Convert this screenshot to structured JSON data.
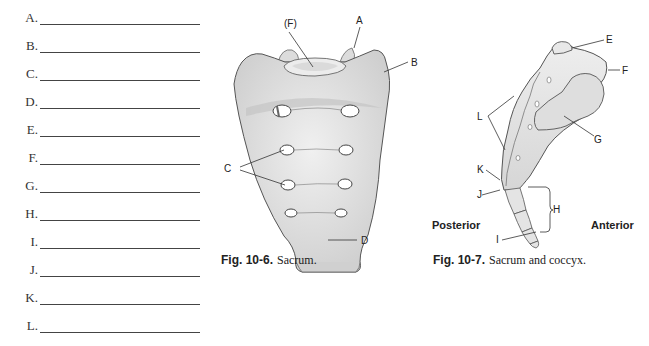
{
  "answer_blanks": [
    {
      "letter": "A."
    },
    {
      "letter": "B."
    },
    {
      "letter": "C."
    },
    {
      "letter": "D."
    },
    {
      "letter": "E."
    },
    {
      "letter": "F."
    },
    {
      "letter": "G."
    },
    {
      "letter": "H."
    },
    {
      "letter": "I."
    },
    {
      "letter": "J."
    },
    {
      "letter": "K."
    },
    {
      "letter": "L."
    }
  ],
  "figure_sacrum": {
    "caption_number": "Fig. 10-6.",
    "caption_text": "Sacrum.",
    "labels": {
      "F": "(F)",
      "A": "A",
      "B": "B",
      "C": "C",
      "D": "D"
    }
  },
  "figure_sacrum_coccyx": {
    "caption_number": "Fig. 10-7.",
    "caption_text": "Sacrum and coccyx.",
    "labels": {
      "E": "E",
      "F": "F",
      "G": "G",
      "L": "L",
      "K": "K",
      "J": "J",
      "H": "H",
      "I": "I"
    },
    "directions": {
      "posterior": "Posterior",
      "anterior": "Anterior"
    }
  },
  "colors": {
    "bone_fill": "#e4e4e4",
    "bone_shade": "#c8c8c8",
    "outline": "#555555",
    "text": "#222222"
  }
}
